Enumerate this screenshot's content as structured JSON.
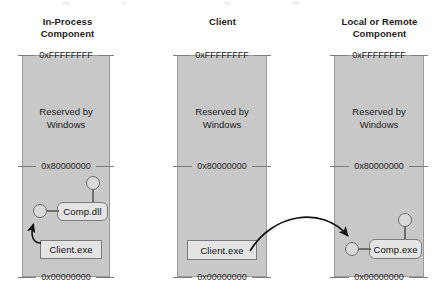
{
  "diagram": {
    "columns": [
      {
        "id": "in-process",
        "title_line1": "In-Process",
        "title_line2": "Component",
        "top_address": "0xFFFFFFFF",
        "mid_address": "0x80000000",
        "bottom_address": "0x00000000",
        "reserved_line1": "Reserved by",
        "reserved_line2": "Windows",
        "modules": [
          {
            "id": "comp-dll",
            "label": "Comp.dll",
            "shape": "rounded"
          },
          {
            "id": "client-exe",
            "label": "Client.exe",
            "shape": "square"
          }
        ]
      },
      {
        "id": "client",
        "title_line1": "Client",
        "title_line2": "",
        "top_address": "0xFFFFFFFF",
        "mid_address": "0x80000000",
        "bottom_address": "0x00000000",
        "reserved_line1": "Reserved by",
        "reserved_line2": "Windows",
        "modules": [
          {
            "id": "client-exe",
            "label": "Client.exe",
            "shape": "square"
          }
        ]
      },
      {
        "id": "local-or-remote",
        "title_line1": "Local or Remote",
        "title_line2": "Component",
        "top_address": "0xFFFFFFFF",
        "mid_address": "0x80000000",
        "bottom_address": "0x00000000",
        "reserved_line1": "Reserved by",
        "reserved_line2": "Windows",
        "modules": [
          {
            "id": "comp-exe",
            "label": "Comp.exe",
            "shape": "rounded"
          }
        ]
      }
    ],
    "colors": {
      "process_fill": "#c8c8c8",
      "process_border": "#9a9a9a",
      "module_fill": "#e4e4e4",
      "module_border": "#7b7b7b",
      "connector": "#6e6e6e",
      "arrow": "#111111",
      "text": "#1c1c1c",
      "background": "#ffffff"
    },
    "connectors": [
      {
        "id": "comp-dll-interface-top",
        "type": "lollipop"
      },
      {
        "id": "comp-dll-interface-left",
        "type": "socket"
      },
      {
        "id": "comp-exe-interface-top",
        "type": "lollipop"
      },
      {
        "id": "comp-exe-interface-left",
        "type": "socket"
      }
    ],
    "arrows": [
      {
        "id": "client-to-comp-dll",
        "from": "client-exe (in-process)",
        "to": "comp-dll socket"
      },
      {
        "id": "client-to-comp-exe",
        "from": "client-exe (client process)",
        "to": "comp-exe socket"
      }
    ]
  }
}
